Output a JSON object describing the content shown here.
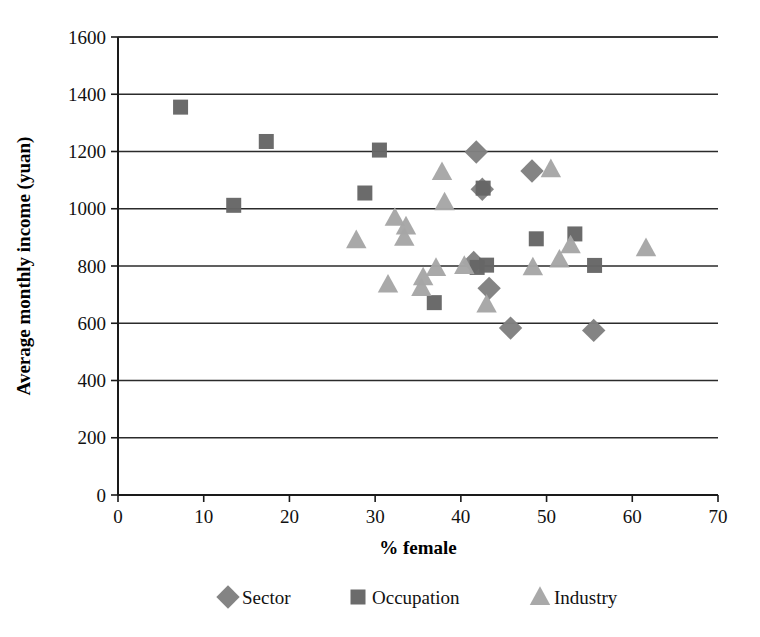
{
  "chart_data": {
    "type": "scatter",
    "title": "",
    "xlabel": "% female",
    "ylabel": "Average monthly income (yuan)",
    "xlim": [
      0,
      70
    ],
    "ylim": [
      0,
      1600
    ],
    "xticks": [
      0,
      10,
      20,
      30,
      40,
      50,
      60,
      70
    ],
    "yticks": [
      0,
      200,
      400,
      600,
      800,
      1000,
      1200,
      1400,
      1600
    ],
    "grid": "horizontal",
    "legend_position": "bottom",
    "colors": {
      "sector": "#808080",
      "occupation": "#666666",
      "industry": "#a6a6a6",
      "axis": "#1a1a1a",
      "grid": "#2b2b2b",
      "background": "#ffffff"
    },
    "series": [
      {
        "name": "Sector",
        "marker": "diamond",
        "color": "#808080",
        "points": [
          {
            "x": 41.8,
            "y": 1198
          },
          {
            "x": 48.3,
            "y": 1132
          },
          {
            "x": 42.5,
            "y": 1068
          },
          {
            "x": 41.5,
            "y": 812
          },
          {
            "x": 43.3,
            "y": 722
          },
          {
            "x": 45.8,
            "y": 583
          },
          {
            "x": 55.5,
            "y": 575
          }
        ]
      },
      {
        "name": "Occupation",
        "marker": "square",
        "color": "#666666",
        "points": [
          {
            "x": 7.3,
            "y": 1355
          },
          {
            "x": 17.3,
            "y": 1235
          },
          {
            "x": 30.5,
            "y": 1205
          },
          {
            "x": 28.8,
            "y": 1055
          },
          {
            "x": 13.5,
            "y": 1012
          },
          {
            "x": 42.6,
            "y": 1072
          },
          {
            "x": 48.8,
            "y": 895
          },
          {
            "x": 53.3,
            "y": 912
          },
          {
            "x": 43.0,
            "y": 803
          },
          {
            "x": 55.6,
            "y": 802
          },
          {
            "x": 36.9,
            "y": 672
          },
          {
            "x": 41.9,
            "y": 795
          }
        ]
      },
      {
        "name": "Industry",
        "marker": "triangle",
        "color": "#a6a6a6",
        "points": [
          {
            "x": 37.8,
            "y": 1128
          },
          {
            "x": 50.5,
            "y": 1138
          },
          {
            "x": 38.1,
            "y": 1022
          },
          {
            "x": 32.3,
            "y": 968
          },
          {
            "x": 33.6,
            "y": 938
          },
          {
            "x": 33.4,
            "y": 898
          },
          {
            "x": 27.8,
            "y": 890
          },
          {
            "x": 61.6,
            "y": 862
          },
          {
            "x": 52.8,
            "y": 872
          },
          {
            "x": 31.5,
            "y": 735
          },
          {
            "x": 35.4,
            "y": 723
          },
          {
            "x": 37.1,
            "y": 793
          },
          {
            "x": 43.0,
            "y": 665
          },
          {
            "x": 40.4,
            "y": 800
          },
          {
            "x": 35.6,
            "y": 760
          },
          {
            "x": 48.4,
            "y": 795
          },
          {
            "x": 51.5,
            "y": 822
          }
        ]
      }
    ],
    "legend": [
      {
        "label": "Sector",
        "marker": "diamond",
        "color": "#808080"
      },
      {
        "label": "Occupation",
        "marker": "square",
        "color": "#666666"
      },
      {
        "label": "Industry",
        "marker": "triangle",
        "color": "#a6a6a6"
      }
    ]
  }
}
